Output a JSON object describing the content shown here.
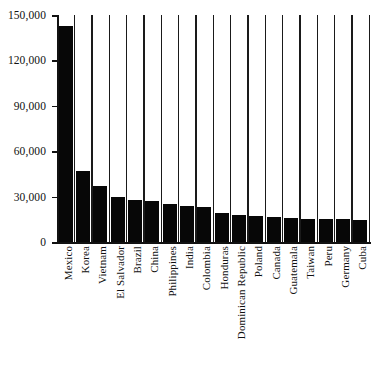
{
  "chart_data": {
    "type": "bar",
    "title": "",
    "subtitle": "",
    "xlabel": "",
    "ylabel": "",
    "ylim": [
      0,
      150000
    ],
    "grid": false,
    "legend": "none",
    "bar_color": "#070707",
    "axis_color": "#111111",
    "y_ticks": [
      0,
      30000,
      60000,
      90000,
      120000,
      150000
    ],
    "y_tick_labels": [
      "0",
      "30,000",
      "60,000",
      "90,000",
      "120,000",
      "150,000"
    ],
    "categories": [
      "Mexico",
      "Korea",
      "Vietnam",
      "El Salvador",
      "Brazil",
      "China",
      "Philippines",
      "India",
      "Colombia",
      "Honduras",
      "Dominican Republic",
      "Poland",
      "Canada",
      "Guatemala",
      "Taiwan",
      "Peru",
      "Germany",
      "Cuba"
    ],
    "values": [
      143000,
      47000,
      37000,
      30000,
      28000,
      27000,
      25000,
      24000,
      23000,
      19000,
      18000,
      17000,
      16500,
      16000,
      15000,
      15000,
      15000,
      14500
    ]
  }
}
